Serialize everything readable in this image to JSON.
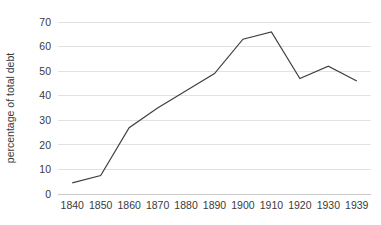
{
  "chart_data": {
    "type": "line",
    "title": "",
    "subtitle": "",
    "xlabel": "",
    "ylabel": "percentage of total debt",
    "categories": [
      "1840",
      "1850",
      "1860",
      "1870",
      "1880",
      "1890",
      "1900",
      "1910",
      "1920",
      "1930",
      "1939"
    ],
    "values": [
      4.5,
      7.5,
      27,
      35,
      42,
      49,
      63,
      66,
      47,
      52,
      46
    ],
    "series": [
      {
        "name": "percentage of total debt",
        "values": [
          4.5,
          7.5,
          27,
          35,
          42,
          49,
          63,
          66,
          47,
          52,
          46
        ]
      }
    ],
    "ylim": [
      0,
      70
    ],
    "ytick_labels": [
      "0",
      "10",
      "20",
      "30",
      "40",
      "50",
      "60",
      "70"
    ],
    "ytick_values": [
      0,
      10,
      20,
      30,
      40,
      50,
      60,
      70
    ],
    "grid": true,
    "grid_axis": "y",
    "legend": false,
    "legend_position": "none",
    "line_color": "#404040",
    "grid_color": "#e2e2e2",
    "axis_color": "#c9c9c9",
    "text_color": "#3a3a3a",
    "background_color": "#ffffff"
  },
  "layout": {
    "plot_left": 58,
    "plot_right": 371,
    "plot_top": 22,
    "plot_bottom": 194
  }
}
